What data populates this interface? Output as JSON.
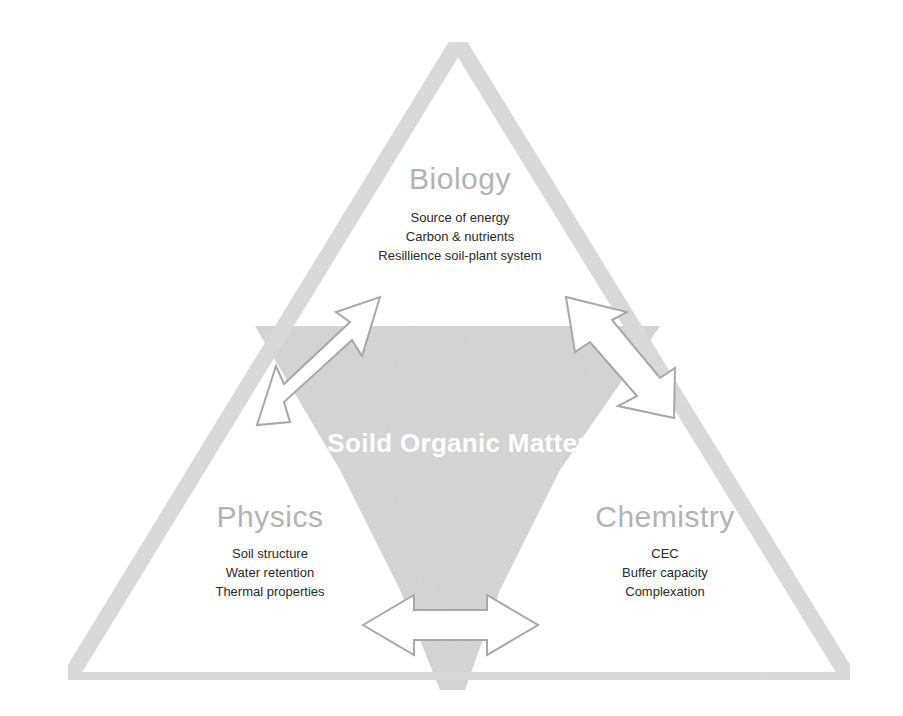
{
  "diagram": {
    "title": "Soild Organic Matter",
    "colors": {
      "triangle_stroke": "#dcdcdc",
      "center_fill": "#d6d6d6",
      "arrow_fill": "#ffffff",
      "arrow_stroke": "#a8a8a8",
      "heading_text": "#b3b3b3",
      "item_text": "#2a2a2a",
      "center_text": "#ffffff"
    },
    "nodes": [
      {
        "id": "biology",
        "heading": "Biology",
        "items": [
          "Source of energy",
          "Carbon & nutrients",
          "Resillience soil-plant system"
        ]
      },
      {
        "id": "physics",
        "heading": "Physics",
        "items": [
          "Soil structure",
          "Water retention",
          "Thermal properties"
        ]
      },
      {
        "id": "chemistry",
        "heading": "Chemistry",
        "items": [
          "CEC",
          "Buffer capacity",
          "Complexation"
        ]
      }
    ],
    "connections": [
      {
        "from": "biology",
        "to": "physics",
        "type": "bidirectional-arrow"
      },
      {
        "from": "biology",
        "to": "chemistry",
        "type": "bidirectional-arrow"
      },
      {
        "from": "physics",
        "to": "chemistry",
        "type": "bidirectional-arrow"
      }
    ]
  }
}
